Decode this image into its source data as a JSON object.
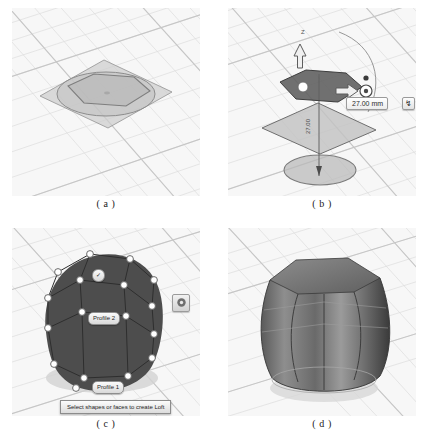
{
  "figure": {
    "panels": [
      {
        "key": "a",
        "caption": "( a )",
        "name": "sketch-profile-panel",
        "description": "Base sketch plane with circular and hexagonal profile"
      },
      {
        "key": "b",
        "caption": "( b )",
        "name": "move-offset-panel",
        "description": "Offset plane manipulator with distance handle"
      },
      {
        "key": "c",
        "caption": "( c )",
        "name": "loft-selection-panel",
        "description": "Loft profile selection with preview body"
      },
      {
        "key": "d",
        "caption": "( d )",
        "name": "lofted-solid-panel",
        "description": "Resulting shaded lofted solid"
      }
    ]
  },
  "panel_b": {
    "dimension_value": "27.00 mm",
    "dimension_axis_label": "27.00",
    "lock_button_icon": "lock-icon",
    "lock_button_glyph": "↯",
    "z_axis_label": "Z"
  },
  "panel_c": {
    "profile_2_label": "Profile 2",
    "profile_1_label": "Profile 1",
    "badge_label": "✓",
    "tooltip": "Select shapes or faces to create Loft",
    "settings_icon": "gear-icon"
  },
  "colors": {
    "page_background": "#ffffff",
    "viewport_background": "#f7f7f7",
    "grid_line": "#d8d8d8",
    "grid_line_major": "#c4c4c4",
    "sketch_plane_fill": "#cfcfcf",
    "sketch_curve": "#8a8a8a",
    "solid_dark": "#4a4a4a",
    "solid_mid": "#7d7d7d",
    "solid_light": "#b4b4b4",
    "handle_white": "#ffffff",
    "handle_stroke": "#555555",
    "caption_text": "#1a1a1a"
  }
}
